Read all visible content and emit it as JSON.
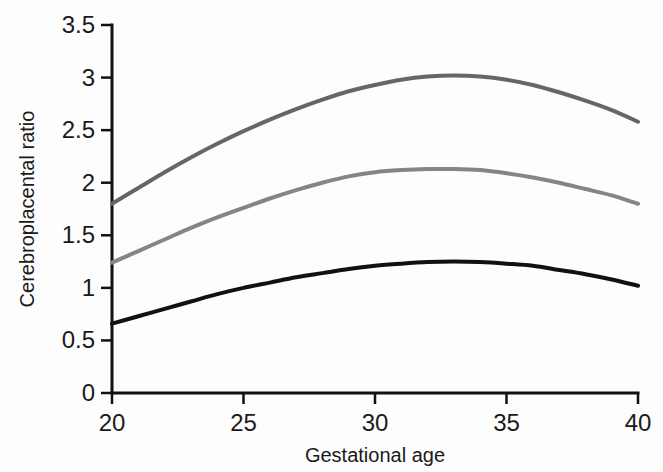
{
  "chart_data": {
    "type": "line",
    "title": "",
    "subtitle": "",
    "xlabel": "Gestational age",
    "ylabel": "Cerebroplacental ratio",
    "xlim": [
      20,
      40
    ],
    "ylim": [
      0,
      3.5
    ],
    "xticks": [
      "20",
      "25",
      "30",
      "35",
      "40"
    ],
    "xtick_values": [
      20,
      25,
      30,
      35,
      40
    ],
    "yticks": [
      "0",
      "0.5",
      "1",
      "1.5",
      "2",
      "2.5",
      "3",
      "3.5"
    ],
    "ytick_values": [
      0,
      0.5,
      1,
      1.5,
      2,
      2.5,
      3,
      3.5
    ],
    "grid": false,
    "legend": "none",
    "x": [
      20,
      21,
      22,
      23,
      24,
      25,
      26,
      27,
      28,
      29,
      30,
      31,
      32,
      33,
      34,
      35,
      36,
      37,
      38,
      39,
      40
    ],
    "series": [
      {
        "name": "95th centile",
        "color": "#666666",
        "linewidth": 4,
        "values": [
          1.8,
          1.95,
          2.1,
          2.24,
          2.37,
          2.49,
          2.6,
          2.7,
          2.79,
          2.87,
          2.93,
          2.98,
          3.01,
          3.02,
          3.01,
          2.98,
          2.93,
          2.86,
          2.78,
          2.69,
          2.58
        ]
      },
      {
        "name": "50th centile",
        "color": "#858585",
        "linewidth": 4,
        "values": [
          1.24,
          1.35,
          1.46,
          1.57,
          1.67,
          1.76,
          1.85,
          1.93,
          2.0,
          2.06,
          2.1,
          2.12,
          2.13,
          2.13,
          2.12,
          2.09,
          2.05,
          2.0,
          1.94,
          1.88,
          1.8
        ]
      },
      {
        "name": "5th centile",
        "color": "#111111",
        "linewidth": 4,
        "values": [
          0.66,
          0.73,
          0.8,
          0.87,
          0.94,
          1.0,
          1.05,
          1.1,
          1.14,
          1.18,
          1.21,
          1.23,
          1.245,
          1.25,
          1.245,
          1.23,
          1.21,
          1.17,
          1.13,
          1.08,
          1.02
        ]
      }
    ],
    "annotations": []
  },
  "axes": {
    "y_axis_label": "Cerebroplacental ratio",
    "x_axis_label": "Gestational age"
  },
  "colors": {
    "upper_curve": "#666666",
    "middle_curve": "#858585",
    "lower_curve": "#111111",
    "axis": "#111111",
    "background": "#fdfdfd",
    "text": "#1a1a1a"
  },
  "geometry": {
    "plot_left": 112,
    "plot_right": 638,
    "plot_top": 25,
    "plot_bottom": 393
  }
}
